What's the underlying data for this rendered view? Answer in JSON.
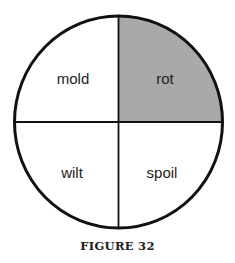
{
  "figure": {
    "caption": "FIGURE 32",
    "quadrants": [
      {
        "position": "top-left",
        "label": "mold",
        "shaded": false
      },
      {
        "position": "top-right",
        "label": "rot",
        "shaded": true
      },
      {
        "position": "bottom-left",
        "label": "wilt",
        "shaded": false
      },
      {
        "position": "bottom-right",
        "label": "spoil",
        "shaded": false
      }
    ],
    "colors": {
      "shade": "#a9a9a9",
      "stroke": "#111111"
    }
  }
}
